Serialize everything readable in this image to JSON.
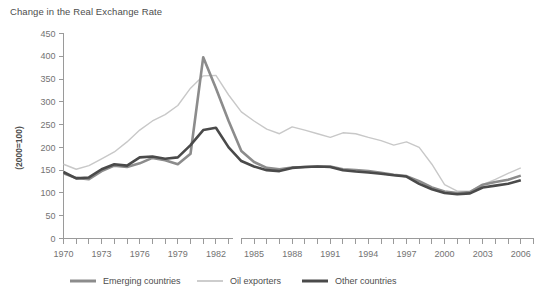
{
  "chart_data": {
    "type": "line",
    "title": "Change in the Real Exchange Rate",
    "xlabel": "",
    "ylabel": "(2000=100)",
    "ylim": [
      0,
      450
    ],
    "ytick_step": 50,
    "yticks": [
      "0",
      "50",
      "100",
      "150",
      "200",
      "250",
      "300",
      "350",
      "400",
      "450"
    ],
    "xlim": [
      1970,
      2007
    ],
    "xticks": [
      "1970",
      "1973",
      "1976",
      "1979",
      "1982",
      "1985",
      "1988",
      "1991",
      "1994",
      "1997",
      "2000",
      "2003",
      "2006"
    ],
    "xtick_years": [
      1970,
      1973,
      1976,
      1979,
      1982,
      1985,
      1988,
      1991,
      1994,
      1997,
      2000,
      2003,
      2006
    ],
    "grid": false,
    "legend_position": "bottom",
    "x": [
      1970,
      1971,
      1972,
      1973,
      1974,
      1975,
      1976,
      1977,
      1978,
      1979,
      1980,
      1981,
      1982,
      1983,
      1984,
      1985,
      1986,
      1987,
      1988,
      1989,
      1990,
      1991,
      1992,
      1993,
      1994,
      1995,
      1996,
      1997,
      1998,
      1999,
      2000,
      2001,
      2002,
      2003,
      2004,
      2005,
      2006
    ],
    "series": [
      {
        "name": "Emerging countries",
        "color": "#8c8c8c",
        "width": 2.6,
        "values": [
          143,
          133,
          130,
          148,
          160,
          157,
          165,
          177,
          172,
          163,
          186,
          398,
          330,
          258,
          192,
          168,
          155,
          152,
          156,
          157,
          158,
          158,
          152,
          150,
          148,
          144,
          140,
          137,
          126,
          112,
          103,
          100,
          102,
          118,
          124,
          129,
          138
        ]
      },
      {
        "name": "Oil exporters",
        "color": "#c8c8c8",
        "width": 1.4,
        "values": [
          163,
          152,
          160,
          175,
          190,
          212,
          238,
          258,
          272,
          292,
          330,
          357,
          358,
          315,
          278,
          258,
          240,
          230,
          245,
          238,
          230,
          222,
          232,
          230,
          222,
          215,
          205,
          212,
          200,
          163,
          118,
          104,
          104,
          118,
          130,
          143,
          155
        ]
      },
      {
        "name": "Other countries",
        "color": "#4a4a4a",
        "width": 2.6,
        "values": [
          146,
          132,
          134,
          152,
          163,
          160,
          178,
          180,
          175,
          178,
          205,
          238,
          243,
          200,
          170,
          158,
          150,
          148,
          155,
          157,
          158,
          157,
          150,
          147,
          145,
          142,
          139,
          136,
          120,
          108,
          100,
          97,
          99,
          112,
          116,
          120,
          128
        ]
      }
    ]
  },
  "legend": [
    {
      "label": "Emerging countries"
    },
    {
      "label": "Oil exporters"
    },
    {
      "label": "Other countries"
    }
  ]
}
